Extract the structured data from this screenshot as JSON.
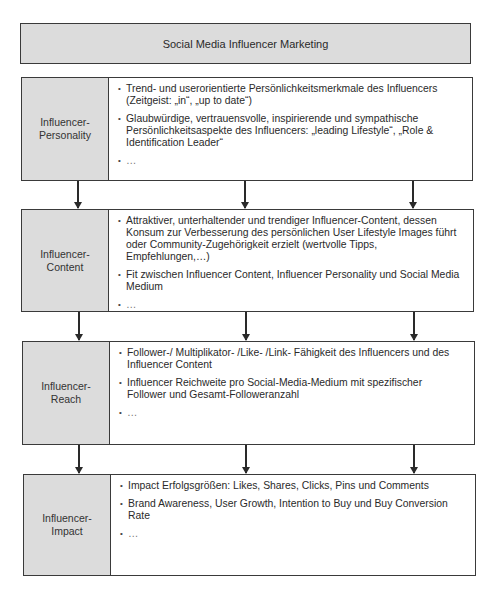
{
  "title": "Social Media Influencer Marketing",
  "layers": [
    {
      "label": "Influencer-\nPersonality",
      "bullets": [
        "Trend- und userorientierte Persönlichkeitsmerkmale des Influencers (Zeitgeist: „in“, „up to date“)",
        "Glaubwürdige, vertrauensvolle, inspirierende und sympathische Persönlichkeitsaspekte des Influencers: „leading Lifestyle“, „Role & Identification Leader“",
        "…"
      ]
    },
    {
      "label": "Influencer-\nContent",
      "bullets": [
        "Attraktiver, unterhaltender und trendiger Influencer-Content, dessen Konsum zur Verbesserung des persönlichen User Lifestyle Images führt oder Community-Zugehörigkeit erzielt (wertvolle Tipps, Empfehlungen,…)",
        "Fit zwischen Influencer Content, Influencer Personality und Social Media Medium",
        "…"
      ]
    },
    {
      "label": "Influencer-\nReach",
      "bullets": [
        "Follower-/ Multiplikator- /Like- /Link- Fähigkeit des Influencers und des Influencer Content",
        "Influencer Reichweite pro Social-Media-Medium mit spezifischer Follower und Gesamt-Followeranzahl",
        "…"
      ]
    },
    {
      "label": "Influencer-\nImpact",
      "bullets": [
        "Impact Erfolgsgrößen: Likes, Shares, Clicks, Pins und Comments",
        "Brand Awareness, User Growth, Intention to Buy und Buy Conversion Rate",
        "…"
      ]
    }
  ],
  "colors": {
    "label_fill": "#dcdcdc",
    "border": "#3a3a3a",
    "text": "#2a2a2a"
  }
}
